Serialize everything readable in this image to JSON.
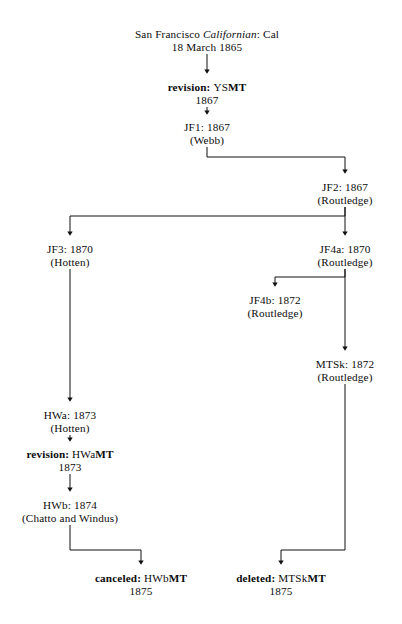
{
  "diagram": {
    "type": "stemma-flowchart",
    "title_node": "San Francisco Californian: Cal",
    "nodes": [
      {
        "id": "cal",
        "line1_pre": "San Francisco ",
        "line1_italic": "Californian",
        "line1_post": ": Cal",
        "line2": "18 March 1865",
        "x": 207,
        "y": 28
      },
      {
        "id": "ysmt",
        "label_bold_prefix": "revision: ",
        "label_plain": "YS",
        "label_bold_suffix": "MT",
        "line2": "1867",
        "x": 207,
        "y": 81
      },
      {
        "id": "jf1",
        "line1": "JF1: 1867",
        "line2": "(Webb)",
        "x": 207,
        "y": 121
      },
      {
        "id": "jf2",
        "line1": "JF2: 1867",
        "line2": "(Routledge)",
        "x": 345,
        "y": 181
      },
      {
        "id": "jf3",
        "line1": "JF3: 1870",
        "line2": "(Hotten)",
        "x": 70,
        "y": 243
      },
      {
        "id": "jf4a",
        "line1": "JF4a: 1870",
        "line2": "(Routledge)",
        "x": 345,
        "y": 243
      },
      {
        "id": "jf4b",
        "line1": "JF4b: 1872",
        "line2": "(Routledge)",
        "x": 275,
        "y": 294
      },
      {
        "id": "mtsk",
        "line1": "MTSk: 1872",
        "line2": "(Routledge)",
        "x": 345,
        "y": 358
      },
      {
        "id": "hwa",
        "line1": "HWa: 1873",
        "line2": "(Hotten)",
        "x": 70,
        "y": 409
      },
      {
        "id": "hwamt",
        "label_bold_prefix": "revision: ",
        "label_plain": "HWa",
        "label_bold_suffix": "MT",
        "line2": "1873",
        "x": 70,
        "y": 448
      },
      {
        "id": "hwb",
        "line1": "HWb: 1874",
        "line2": "(Chatto and Windus)",
        "x": 70,
        "y": 499
      },
      {
        "id": "hwbmt",
        "label_bold_prefix": "canceled: ",
        "label_plain": "HWb",
        "label_bold_suffix": "MT",
        "line2": "1875",
        "x": 141,
        "y": 572
      },
      {
        "id": "mtskmt",
        "label_bold_prefix": "deleted: ",
        "label_plain": "MTSk",
        "label_bold_suffix": "MT",
        "line2": "1875",
        "x": 281,
        "y": 572
      }
    ],
    "edges": [
      {
        "from": "cal",
        "to": "ysmt"
      },
      {
        "from": "ysmt",
        "to": "jf1"
      },
      {
        "from": "jf1",
        "to": "jf2"
      },
      {
        "from": "jf2",
        "to": "jf3"
      },
      {
        "from": "jf2",
        "to": "jf4a"
      },
      {
        "from": "jf4a",
        "to": "jf4b"
      },
      {
        "from": "jf4a",
        "to": "mtsk"
      },
      {
        "from": "jf3",
        "to": "hwa"
      },
      {
        "from": "hwa",
        "to": "hwamt"
      },
      {
        "from": "hwamt",
        "to": "hwb"
      },
      {
        "from": "hwb",
        "to": "hwbmt"
      },
      {
        "from": "mtsk",
        "to": "mtskmt"
      }
    ],
    "stroke_color": "#111111"
  }
}
